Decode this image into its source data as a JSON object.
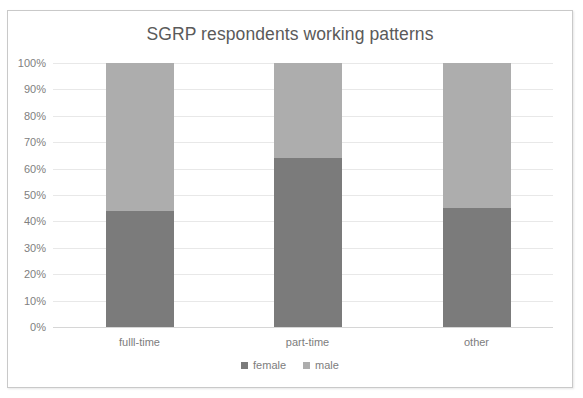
{
  "chart_data": {
    "type": "bar",
    "subtype": "stacked-100-percent",
    "title": "SGRP respondents working patterns",
    "xlabel": "",
    "ylabel": "",
    "categories": [
      "fulll-time",
      "part-time",
      "other"
    ],
    "series": [
      {
        "name": "female",
        "color": "#7b7b7b",
        "values": [
          44,
          64,
          45
        ]
      },
      {
        "name": "male",
        "color": "#adadad",
        "values": [
          56,
          36,
          55
        ]
      }
    ],
    "ylim": [
      0,
      100
    ],
    "ytick_labels": [
      "100%",
      "90%",
      "80%",
      "70%",
      "60%",
      "50%",
      "40%",
      "30%",
      "20%",
      "10%",
      "0%"
    ],
    "ytick_values": [
      100,
      90,
      80,
      70,
      60,
      50,
      40,
      30,
      20,
      10,
      0
    ],
    "grid": true,
    "legend_position": "bottom",
    "legend_entries": [
      "female",
      "male"
    ]
  },
  "colors": {
    "female": "#7b7b7b",
    "male": "#adadad",
    "gridline": "#e8e8e8",
    "axis_text": "#808080",
    "title_text": "#5a5a5a",
    "frame_border": "#c9c9c9"
  }
}
